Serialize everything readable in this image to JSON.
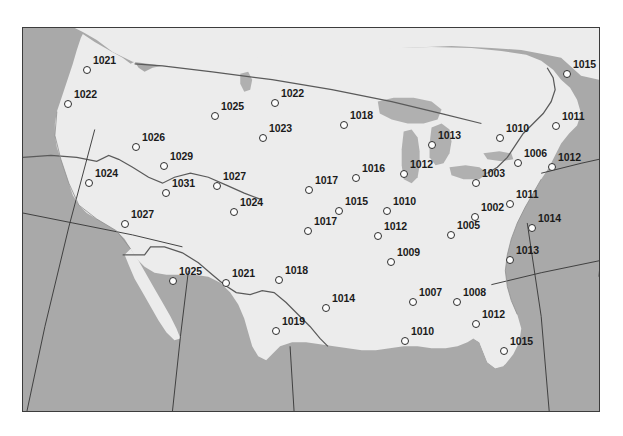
{
  "figure": {
    "kind": "surface-pressure-station-map",
    "region": "Continental United States",
    "units": "hPa",
    "frame": {
      "x": 22,
      "y": 27,
      "width": 578,
      "height": 385
    }
  },
  "colors": {
    "ocean": "#a9a9a9",
    "land": "#ececec",
    "lake": "#b0b0b0",
    "border_line": "#5a5a5a",
    "grid_line": "#3a3a3a",
    "frame": "#3c3c3c",
    "station_fill": "#fdfdfd",
    "station_stroke": "#2e2e2e",
    "label_text": "#1b1b1b"
  },
  "chart_data": {
    "type": "scatter",
    "title": "",
    "xlabel": "",
    "ylabel": "",
    "value_label": "Sea-level pressure (hPa)",
    "stations": [
      {
        "value": "1021",
        "x": 64,
        "y": 42
      },
      {
        "value": "1022",
        "x": 45,
        "y": 76
      },
      {
        "value": "1026",
        "x": 113,
        "y": 119
      },
      {
        "value": "1029",
        "x": 141,
        "y": 138
      },
      {
        "value": "1025",
        "x": 192,
        "y": 88
      },
      {
        "value": "1022",
        "x": 252,
        "y": 75
      },
      {
        "value": "1023",
        "x": 240,
        "y": 110
      },
      {
        "value": "1027",
        "x": 194,
        "y": 158
      },
      {
        "value": "1024",
        "x": 66,
        "y": 155
      },
      {
        "value": "1031",
        "x": 143,
        "y": 165
      },
      {
        "value": "1024",
        "x": 211,
        "y": 184
      },
      {
        "value": "1027",
        "x": 102,
        "y": 196
      },
      {
        "value": "1018",
        "x": 321,
        "y": 97
      },
      {
        "value": "1013",
        "x": 409,
        "y": 117
      },
      {
        "value": "1010",
        "x": 477,
        "y": 110
      },
      {
        "value": "1011",
        "x": 533,
        "y": 98
      },
      {
        "value": "1015",
        "x": 544,
        "y": 46
      },
      {
        "value": "1006",
        "x": 495,
        "y": 135
      },
      {
        "value": "1012",
        "x": 529,
        "y": 139
      },
      {
        "value": "1003",
        "x": 453,
        "y": 155
      },
      {
        "value": "1016",
        "x": 333,
        "y": 150
      },
      {
        "value": "1012",
        "x": 381,
        "y": 146
      },
      {
        "value": "1017",
        "x": 286,
        "y": 162
      },
      {
        "value": "1015",
        "x": 316,
        "y": 183
      },
      {
        "value": "1010",
        "x": 364,
        "y": 183
      },
      {
        "value": "1002",
        "x": 452,
        "y": 189
      },
      {
        "value": "1011",
        "x": 487,
        "y": 176
      },
      {
        "value": "1014",
        "x": 509,
        "y": 200
      },
      {
        "value": "1017",
        "x": 285,
        "y": 203
      },
      {
        "value": "1012",
        "x": 355,
        "y": 208
      },
      {
        "value": "1005",
        "x": 428,
        "y": 207
      },
      {
        "value": "1009",
        "x": 368,
        "y": 234
      },
      {
        "value": "1013",
        "x": 487,
        "y": 232
      },
      {
        "value": "1018",
        "x": 256,
        "y": 252
      },
      {
        "value": "1021",
        "x": 203,
        "y": 255
      },
      {
        "value": "1025",
        "x": 150,
        "y": 253
      },
      {
        "value": "1014",
        "x": 303,
        "y": 280
      },
      {
        "value": "1019",
        "x": 253,
        "y": 303
      },
      {
        "value": "1007",
        "x": 390,
        "y": 274
      },
      {
        "value": "1008",
        "x": 434,
        "y": 274
      },
      {
        "value": "1012",
        "x": 453,
        "y": 296
      },
      {
        "value": "1010",
        "x": 382,
        "y": 313
      },
      {
        "value": "1015",
        "x": 481,
        "y": 323
      }
    ]
  }
}
